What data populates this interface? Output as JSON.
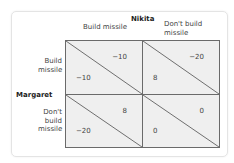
{
  "players": {
    "column": "Nikita",
    "row": "Margaret"
  },
  "column_strategies": [
    "Build missile",
    "Don't build missile"
  ],
  "row_strategies": [
    "Build missile",
    "Don't build missile"
  ],
  "cells": [
    {
      "row": "Build missile",
      "col": "Build missile",
      "column_payoff": "−10",
      "row_payoff": "−10"
    },
    {
      "row": "Build missile",
      "col": "Don't build missile",
      "column_payoff": "−20",
      "row_payoff": "8"
    },
    {
      "row": "Don't build missile",
      "col": "Build missile",
      "column_payoff": "8",
      "row_payoff": "−20"
    },
    {
      "row": "Don't build missile",
      "col": "Don't build missile",
      "column_payoff": "0",
      "row_payoff": "0"
    }
  ],
  "colors": {
    "cell_fill": "#efefef",
    "grid_line": "#6a6a6a"
  }
}
